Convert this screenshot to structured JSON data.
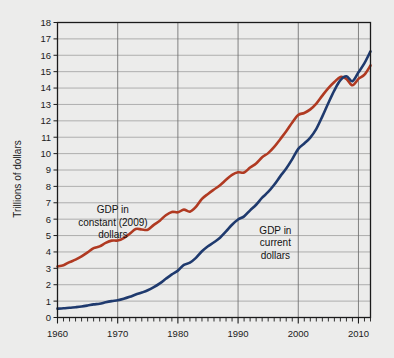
{
  "chart_data": {
    "type": "line",
    "title": "",
    "subtitle": "",
    "xlabel": "",
    "ylabel": "Trillions of dollars",
    "xlim": [
      1960,
      2012
    ],
    "ylim": [
      0,
      18
    ],
    "ytick_step": 1,
    "xtick_step": 10,
    "minor_xtick_step": 1,
    "grid": true,
    "legend_position": "inline-annotations",
    "xticks": [
      "1960",
      "1970",
      "1980",
      "1990",
      "2000",
      "2010"
    ],
    "yticks": [
      "0",
      "1",
      "2",
      "3",
      "4",
      "5",
      "6",
      "7",
      "8",
      "9",
      "10",
      "11",
      "12",
      "13",
      "14",
      "15",
      "16",
      "17",
      "18"
    ],
    "x": [
      1960,
      1961,
      1962,
      1963,
      1964,
      1965,
      1966,
      1967,
      1968,
      1969,
      1970,
      1971,
      1972,
      1973,
      1974,
      1975,
      1976,
      1977,
      1978,
      1979,
      1980,
      1981,
      1982,
      1983,
      1984,
      1985,
      1986,
      1987,
      1988,
      1989,
      1990,
      1991,
      1992,
      1993,
      1994,
      1995,
      1996,
      1997,
      1998,
      1999,
      2000,
      2001,
      2002,
      2003,
      2004,
      2005,
      2006,
      2007,
      2008,
      2009,
      2010,
      2011,
      2012
    ],
    "series": [
      {
        "name": "GDP in constant (2009) dollars",
        "color": "#b03a22",
        "values": [
          3.11,
          3.19,
          3.38,
          3.53,
          3.73,
          3.97,
          4.23,
          4.34,
          4.55,
          4.69,
          4.7,
          4.85,
          5.11,
          5.4,
          5.37,
          5.36,
          5.65,
          5.91,
          6.24,
          6.44,
          6.42,
          6.58,
          6.46,
          6.75,
          7.24,
          7.54,
          7.81,
          8.07,
          8.4,
          8.7,
          8.86,
          8.85,
          9.15,
          9.4,
          9.78,
          10.03,
          10.41,
          10.88,
          11.36,
          11.9,
          12.36,
          12.48,
          12.7,
          13.05,
          13.54,
          14.0,
          14.37,
          14.68,
          14.56,
          14.17,
          14.56,
          14.82,
          15.38
        ]
      },
      {
        "name": "GDP in current dollars",
        "color": "#1f3a6e",
        "values": [
          0.54,
          0.56,
          0.6,
          0.63,
          0.67,
          0.73,
          0.8,
          0.84,
          0.93,
          1.0,
          1.05,
          1.14,
          1.26,
          1.4,
          1.52,
          1.66,
          1.85,
          2.08,
          2.36,
          2.63,
          2.86,
          3.21,
          3.35,
          3.64,
          4.04,
          4.35,
          4.59,
          4.87,
          5.25,
          5.66,
          5.98,
          6.17,
          6.54,
          6.88,
          7.31,
          7.66,
          8.1,
          8.61,
          9.09,
          9.66,
          10.29,
          10.62,
          10.98,
          11.51,
          12.27,
          13.09,
          13.86,
          14.48,
          14.72,
          14.42,
          14.96,
          15.52,
          16.24
        ]
      }
    ],
    "annotations": [
      {
        "id": "annotation-constant-dollars",
        "lines": [
          "GDP in",
          "constant (2009)",
          "dollars"
        ],
        "x": 1969.2,
        "y": 6.35,
        "color": "#121212"
      },
      {
        "id": "annotation-current-dollars",
        "lines": [
          "GDP in",
          "current",
          "dollars"
        ],
        "x": 1996.2,
        "y": 5.1,
        "color": "#121212"
      }
    ],
    "colors": {
      "background": "#ececeb",
      "plot_background": "#ececeb",
      "axis": "#1b1b1b",
      "grid_major": "#6e6e6e",
      "grid_minor": "#9a9a9a",
      "constant_dollars": "#b03a22",
      "current_dollars": "#1f3a6e"
    }
  }
}
